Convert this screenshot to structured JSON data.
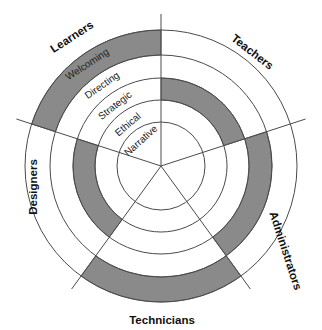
{
  "diagram": {
    "center": [
      161,
      166
    ],
    "ring_radii": [
      44,
      66,
      88,
      111,
      136
    ],
    "spoke_length": 152,
    "spoke_angles_deg": [
      -90,
      -18,
      54,
      126,
      198
    ],
    "colors": {
      "band_fill": "#8a8a8a",
      "line": "#4a4a4a",
      "background": "#ffffff"
    },
    "rings": [
      {
        "label": "Narrative"
      },
      {
        "label": "Ethical"
      },
      {
        "label": "Strategic"
      },
      {
        "label": "Directing"
      },
      {
        "label": "Welcoming"
      }
    ],
    "sectors": [
      {
        "label": "Learners",
        "highlighted_ring": "Welcoming"
      },
      {
        "label": "Teachers",
        "highlighted_ring": "Strategic"
      },
      {
        "label": "Administrators",
        "highlighted_ring": "Directing"
      },
      {
        "label": "Technicians",
        "highlighted_ring": "Welcoming"
      },
      {
        "label": "Designers",
        "highlighted_ring": "Strategic"
      }
    ]
  }
}
